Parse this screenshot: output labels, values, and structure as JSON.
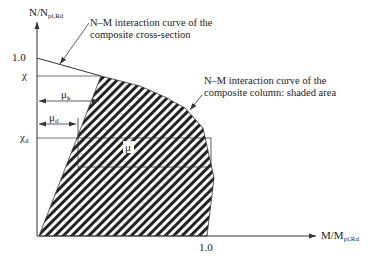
{
  "axes": {
    "y_label_main": "N/N",
    "y_label_sub": "pl,Rd",
    "x_label_main": "M/M",
    "x_label_sub": "pl,Rd",
    "y_tick_one": "1.0",
    "x_tick_one": "1.0",
    "chi": "χ",
    "chi_d_main": "χ",
    "chi_d_sub": "d"
  },
  "markers": {
    "mu_k_main": "μ",
    "mu_k_sub": "k",
    "mu_d_main": "μ",
    "mu_d_sub": "d",
    "mu": "μ"
  },
  "annotations": {
    "cross_section_line1": "N–M interaction curve of the",
    "cross_section_line2": "composite cross-section",
    "column_line1": "N–M interaction curve of the",
    "column_line2": "composite column: shaded area"
  },
  "colors": {
    "line": "#333333",
    "hatch": "#222222",
    "background": "#ffffff"
  }
}
